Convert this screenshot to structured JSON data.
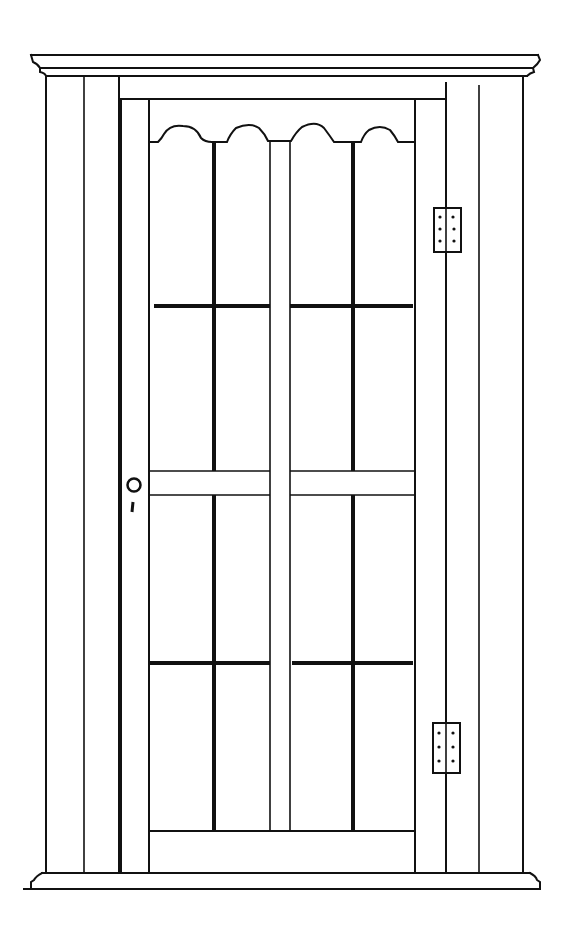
{
  "drawing": {
    "subject": "Glazed cupboard door in frame",
    "background": "#ffffff",
    "ink": "#111111",
    "parts": {
      "cornice": "top molding",
      "base": "bottom molding",
      "door": "glazed door with scalloped top rail",
      "hinges": 2,
      "knob": 1,
      "keyhole": 1,
      "panes": 16
    }
  }
}
